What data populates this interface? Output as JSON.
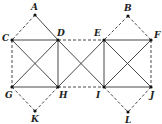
{
  "diagram": {
    "points": [
      {
        "id": "A",
        "x": 35,
        "y": 15,
        "lx": 31,
        "ly": 10
      },
      {
        "id": "B",
        "x": 128,
        "y": 16,
        "lx": 124,
        "ly": 11
      },
      {
        "id": "C",
        "x": 12,
        "y": 40,
        "lx": 2,
        "ly": 41
      },
      {
        "id": "D",
        "x": 58,
        "y": 40,
        "lx": 57,
        "ly": 36
      },
      {
        "id": "E",
        "x": 104,
        "y": 40,
        "lx": 94,
        "ly": 36
      },
      {
        "id": "F",
        "x": 151,
        "y": 40,
        "lx": 154,
        "ly": 38
      },
      {
        "id": "G",
        "x": 12,
        "y": 87,
        "lx": 5,
        "ly": 98
      },
      {
        "id": "H",
        "x": 58,
        "y": 87,
        "lx": 59,
        "ly": 98
      },
      {
        "id": "I",
        "x": 104,
        "y": 87,
        "lx": 96,
        "ly": 98
      },
      {
        "id": "J",
        "x": 151,
        "y": 87,
        "lx": 150,
        "ly": 98
      },
      {
        "id": "K",
        "x": 35,
        "y": 111,
        "lx": 31,
        "ly": 122
      },
      {
        "id": "L",
        "x": 128,
        "y": 112,
        "lx": 125,
        "ly": 123
      }
    ],
    "solid_segments": [
      [
        "C",
        "D"
      ],
      [
        "A",
        "D"
      ],
      [
        "D",
        "I"
      ],
      [
        "C",
        "H"
      ],
      [
        "D",
        "G"
      ],
      [
        "D",
        "H"
      ],
      [
        "G",
        "H"
      ],
      [
        "E",
        "H"
      ],
      [
        "E",
        "I"
      ],
      [
        "E",
        "F"
      ],
      [
        "I",
        "J"
      ],
      [
        "E",
        "J"
      ],
      [
        "F",
        "I"
      ]
    ],
    "dashed_segments": [
      [
        "A",
        "C"
      ],
      [
        "C",
        "G"
      ],
      [
        "D",
        "E"
      ],
      [
        "H",
        "I"
      ],
      [
        "B",
        "E"
      ],
      [
        "B",
        "F"
      ],
      [
        "F",
        "J"
      ],
      [
        "G",
        "K"
      ],
      [
        "H",
        "K"
      ],
      [
        "I",
        "L"
      ],
      [
        "J",
        "L"
      ]
    ]
  }
}
